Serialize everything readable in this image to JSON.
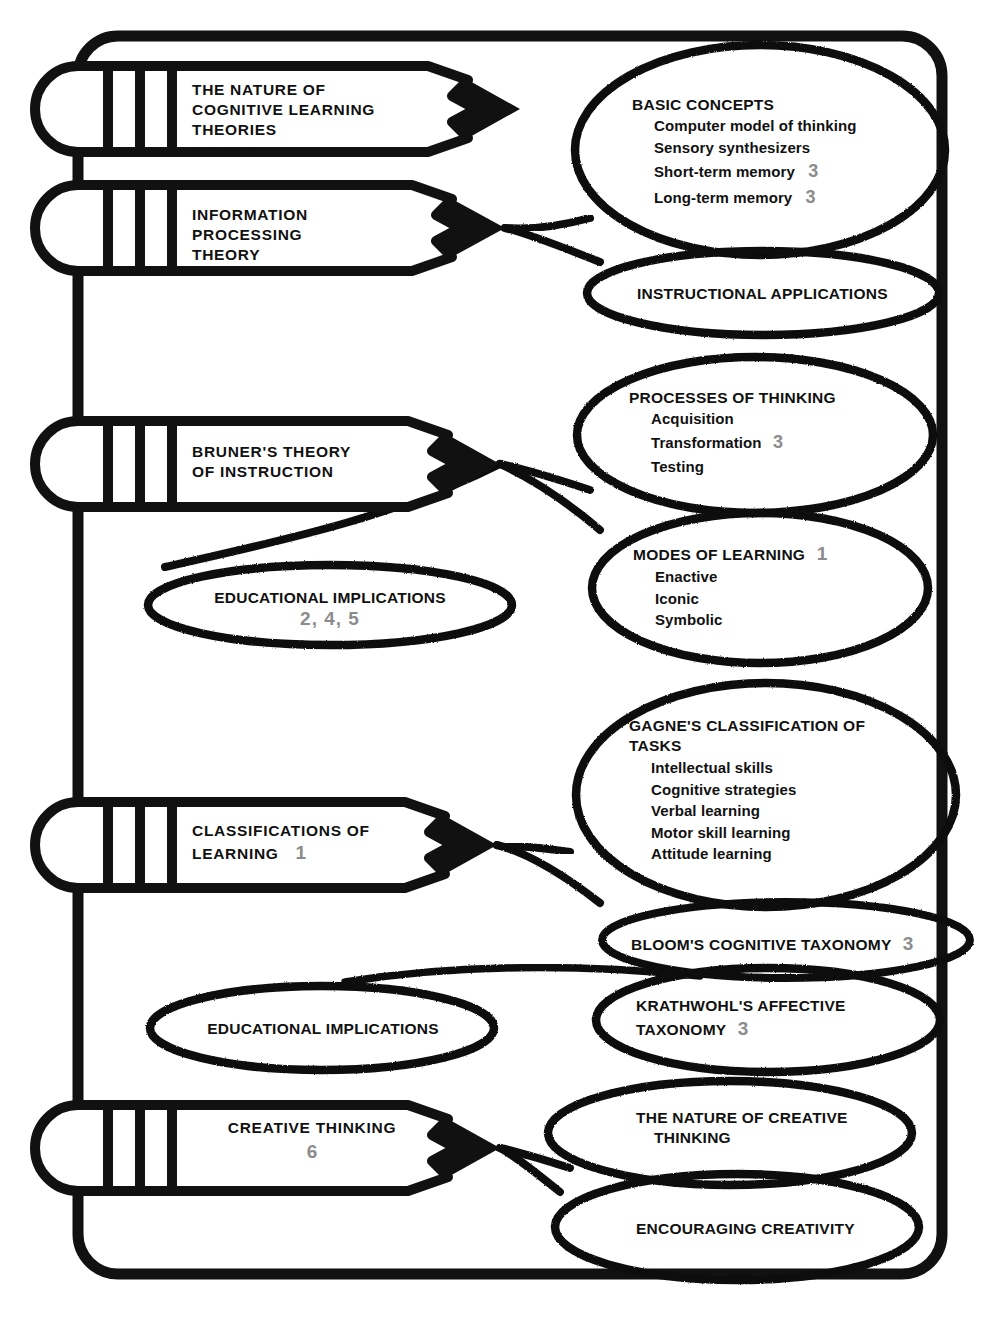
{
  "document": {
    "title": "The Nature of Cognitive Learning Theories — Chapter Organizer",
    "accent_number_color": "#8c8c8c",
    "ink_color": "#111111"
  },
  "pencils": [
    {
      "id": "pencil-nature-of-cognitive-learning-theories",
      "lines": [
        "THE NATURE OF",
        "COGNITIVE LEARNING",
        "THEORIES"
      ],
      "number": ""
    },
    {
      "id": "pencil-information-processing-theory",
      "lines": [
        "INFORMATION",
        "PROCESSING",
        "THEORY"
      ],
      "number": ""
    },
    {
      "id": "pencil-bruners-theory-of-instruction",
      "lines": [
        "BRUNER'S THEORY",
        "OF INSTRUCTION"
      ],
      "number": ""
    },
    {
      "id": "pencil-classifications-of-learning",
      "lines": [
        "CLASSIFICATIONS OF",
        "LEARNING"
      ],
      "number": "1"
    },
    {
      "id": "pencil-creative-thinking",
      "lines": [
        "CREATIVE THINKING"
      ],
      "number": "6"
    }
  ],
  "bubbles": [
    {
      "id": "bubble-basic-concepts",
      "title": "BASIC CONCEPTS",
      "title_number": "",
      "items": [
        {
          "label": "Computer model of thinking",
          "number": ""
        },
        {
          "label": "Sensory synthesizers",
          "number": ""
        },
        {
          "label": "Short-term memory",
          "number": "3"
        },
        {
          "label": "Long-term memory",
          "number": "3"
        }
      ]
    },
    {
      "id": "bubble-instructional-applications",
      "title": "INSTRUCTIONAL APPLICATIONS",
      "title_number": "",
      "items": []
    },
    {
      "id": "bubble-processes-of-thinking",
      "title": "PROCESSES OF THINKING",
      "title_number": "",
      "items": [
        {
          "label": "Acquisition",
          "number": ""
        },
        {
          "label": "Transformation",
          "number": "3"
        },
        {
          "label": "Testing",
          "number": ""
        }
      ]
    },
    {
      "id": "bubble-modes-of-learning",
      "title": "MODES OF LEARNING",
      "title_number": "1",
      "items": [
        {
          "label": "Enactive",
          "number": ""
        },
        {
          "label": "Iconic",
          "number": ""
        },
        {
          "label": "Symbolic",
          "number": ""
        }
      ]
    },
    {
      "id": "bubble-educational-implications-bruner",
      "title": "EDUCATIONAL IMPLICATIONS",
      "title_number": "",
      "number_line": "2, 4, 5",
      "items": []
    },
    {
      "id": "bubble-gagnes-classification-of-tasks",
      "title": "GAGNE'S CLASSIFICATION OF TASKS",
      "title_line_1": "GAGNE'S CLASSIFICATION OF",
      "title_line_2": "TASKS",
      "title_number": "",
      "items": [
        {
          "label": "Intellectual skills",
          "number": ""
        },
        {
          "label": "Cognitive strategies",
          "number": ""
        },
        {
          "label": "Verbal learning",
          "number": ""
        },
        {
          "label": "Motor skill learning",
          "number": ""
        },
        {
          "label": "Attitude learning",
          "number": ""
        }
      ]
    },
    {
      "id": "bubble-blooms-cognitive-taxonomy",
      "title": "BLOOM'S COGNITIVE TAXONOMY",
      "title_number": "3",
      "items": []
    },
    {
      "id": "bubble-krathwohls-affective-taxonomy",
      "title": "KRATHWOHL'S AFFECTIVE TAXONOMY",
      "title_line_1": "KRATHWOHL'S AFFECTIVE",
      "title_line_2": "TAXONOMY",
      "title_number": "3",
      "items": []
    },
    {
      "id": "bubble-educational-implications-classifications",
      "title": "EDUCATIONAL IMPLICATIONS",
      "title_number": "",
      "items": []
    },
    {
      "id": "bubble-the-nature-of-creative-thinking",
      "title": "THE NATURE OF CREATIVE THINKING",
      "title_line_1": "THE NATURE OF CREATIVE",
      "title_line_2": "THINKING",
      "title_number": "",
      "items": []
    },
    {
      "id": "bubble-encouraging-creativity",
      "title": "ENCOURAGING CREATIVITY",
      "title_number": "",
      "items": []
    }
  ]
}
